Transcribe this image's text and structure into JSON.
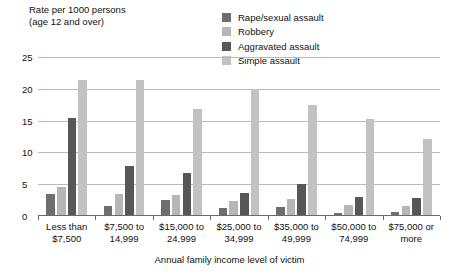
{
  "chart_data": {
    "type": "bar",
    "title": "",
    "ylabel": "Rate per 1000 persons\n(age 12 and over)",
    "xlabel": "Annual family income level of victim",
    "grid": true,
    "legend_position": "top-right",
    "ylim": [
      0,
      25
    ],
    "yticks": [
      "0",
      "5",
      "10",
      "15",
      "20",
      "25"
    ],
    "ytick_values": [
      0,
      5,
      10,
      15,
      20,
      25
    ],
    "categories": [
      "Less than\n$7,500",
      "$7,500 to\n14,999",
      "$15,000 to\n24,999",
      "$25,000 to\n34,999",
      "$35,000 to\n49,999",
      "$50,000 to\n74,999",
      "$75,000 or\nmore"
    ],
    "series": [
      {
        "name": "Rape/sexual assault",
        "color": "#6e6e6e",
        "values": [
          3.5,
          1.5,
          2.5,
          1.2,
          1.4,
          0.5,
          0.6
        ]
      },
      {
        "name": "Robbery",
        "color": "#b6b6b6",
        "values": [
          4.5,
          3.4,
          3.3,
          2.3,
          2.6,
          1.8,
          1.6
        ]
      },
      {
        "name": "Aggravated assault",
        "color": "#575757",
        "values": [
          15.4,
          7.9,
          6.8,
          3.6,
          5.0,
          3.0,
          2.8
        ]
      },
      {
        "name": "Simple assault",
        "color": "#c2c2c2",
        "values": [
          21.4,
          21.4,
          16.8,
          20.0,
          17.4,
          15.2,
          12.1
        ]
      }
    ]
  },
  "colors": {
    "gridline": "#b9b9b9",
    "axis": "#6a6a6a",
    "text": "#111111",
    "background": "#ffffff"
  }
}
